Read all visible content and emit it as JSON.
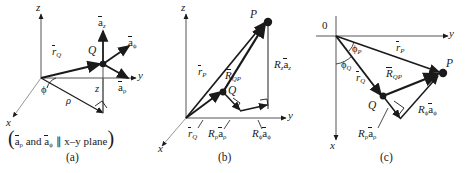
{
  "figure": {
    "background": "#ffffff",
    "ink": "#1a1a1a",
    "panels": [
      {
        "id": "a",
        "caption": "(a)",
        "note_open": "(",
        "note_close": ")",
        "note_a_rho": "a",
        "note_and": " and ",
        "note_a_phi": "a",
        "note_tail": " ∥ x–y plane",
        "sub_rho": "ρ",
        "sub_phi": "ϕ",
        "axes": {
          "x": "x",
          "y": "y",
          "z": "z"
        },
        "point": "Q",
        "vectors": [
          {
            "name": "r_Q",
            "base": "r",
            "sub": "Q"
          }
        ],
        "unit_vectors": [
          {
            "name": "a_z",
            "base": "a",
            "sub": "z"
          },
          {
            "name": "a_phi",
            "base": "a",
            "sub": "ϕ"
          },
          {
            "name": "a_rho",
            "base": "a",
            "sub": "ρ"
          }
        ],
        "scalars": [
          {
            "name": "phi",
            "text": "ϕ"
          },
          {
            "name": "rho",
            "text": "ρ"
          },
          {
            "name": "z",
            "text": "z"
          }
        ]
      },
      {
        "id": "b",
        "caption": "(b)",
        "axes": {
          "x": "x",
          "y": "y",
          "z": "z"
        },
        "points": [
          {
            "name": "P",
            "label": "P"
          },
          {
            "name": "Q",
            "label": "Q"
          }
        ],
        "vectors": [
          {
            "name": "r_P",
            "base": "r",
            "sub": "P"
          },
          {
            "name": "r_Q",
            "base": "r",
            "sub": "Q"
          },
          {
            "name": "R_QP",
            "base": "R",
            "sub": "QP"
          }
        ],
        "components": [
          {
            "name": "R_z_a_z",
            "mag": "R",
            "mag_sub": "z",
            "unit": "a",
            "unit_sub": "z"
          },
          {
            "name": "R_rho_a_rho",
            "mag": "R",
            "mag_sub": "ρ",
            "unit": "a",
            "unit_sub": "ρ"
          },
          {
            "name": "R_phi_a_phi",
            "mag": "R",
            "mag_sub": "ϕ",
            "unit": "a",
            "unit_sub": "ϕ"
          }
        ]
      },
      {
        "id": "c",
        "caption": "(c)",
        "origin": "0",
        "axes": {
          "x": "x",
          "y": "y"
        },
        "points": [
          {
            "name": "P",
            "label": "P"
          },
          {
            "name": "Q",
            "label": "Q"
          }
        ],
        "vectors": [
          {
            "name": "r_P",
            "base": "r",
            "sub": "P"
          },
          {
            "name": "r_Q",
            "base": "r",
            "sub": "Q"
          },
          {
            "name": "R_QP",
            "base": "R",
            "sub": "QP"
          }
        ],
        "angles": [
          {
            "name": "phi_P",
            "base": "ϕ",
            "sub": "P"
          },
          {
            "name": "phi_Q",
            "base": "ϕ",
            "sub": "Q"
          }
        ],
        "components": [
          {
            "name": "R_phi_a_phi",
            "mag": "R",
            "mag_sub": "ϕ",
            "unit": "a",
            "unit_sub": "ϕ"
          },
          {
            "name": "R_rho_a_rho",
            "mag": "R",
            "mag_sub": "ρ",
            "unit": "a",
            "unit_sub": "ρ"
          }
        ]
      }
    ]
  }
}
